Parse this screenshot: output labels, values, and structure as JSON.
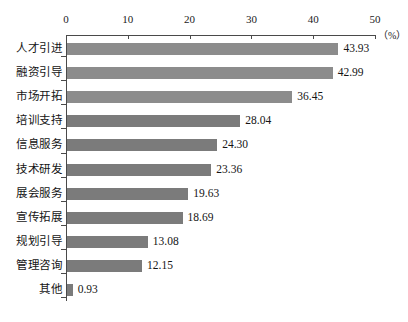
{
  "chart_data": {
    "type": "bar",
    "orientation": "horizontal",
    "title": "",
    "xlabel": "（%）",
    "ylabel": "",
    "xlim": [
      0,
      50
    ],
    "grid": false,
    "legend": null,
    "axis_ticks": [
      "0",
      "10",
      "20",
      "30",
      "40",
      "50"
    ],
    "axis_tick_values": [
      0,
      10,
      20,
      30,
      40,
      50
    ],
    "categories": [
      "人才引进",
      "融资引导",
      "市场开拓",
      "培训支持",
      "信息服务",
      "技术研发",
      "展会服务",
      "宣传拓展",
      "规划引导",
      "管理咨询",
      "其他"
    ],
    "values": [
      43.93,
      42.99,
      36.45,
      28.04,
      24.3,
      23.36,
      19.63,
      18.69,
      13.08,
      12.15,
      0.93
    ],
    "value_labels": [
      "43.93",
      "42.99",
      "36.45",
      "28.04",
      "24.30",
      "23.36",
      "19.63",
      "18.69",
      "13.08",
      "12.15",
      "0.93"
    ],
    "bar_color": "#8c8c8c",
    "bar_color_alt": "#7b7b7b",
    "axis_color": "#4a4a4a",
    "background_color": "#ffffff"
  }
}
